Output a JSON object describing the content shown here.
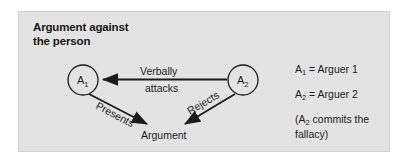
{
  "figure": {
    "title_line1": "Argument against",
    "title_line2": "the person",
    "panel_color": "#e3e3e3",
    "ink_color": "#1b1b1b"
  },
  "nodes": [
    {
      "id": "a1",
      "base": "A",
      "sub": "1",
      "cx": 83,
      "cy": 80,
      "r": 15
    },
    {
      "id": "a2",
      "base": "A",
      "sub": "2",
      "cx": 243,
      "cy": 80,
      "r": 15
    }
  ],
  "edges": [
    {
      "id": "attacks",
      "label_line1": "Verbally",
      "label_line2": "attacks",
      "from": "a2",
      "to": "a1"
    },
    {
      "id": "presents",
      "label": "Presents",
      "from": "a1",
      "to": "argument"
    },
    {
      "id": "rejects",
      "label": "Rejects",
      "from": "a2",
      "to": "argument"
    }
  ],
  "argument_node": {
    "label": "Argument"
  },
  "legend": {
    "row1_symbol": "A",
    "row1_sub": "1",
    "row1_text": " = Arguer 1",
    "row2_symbol": "A",
    "row2_sub": "2",
    "row2_text": " = Arguer 2",
    "row3_prefix": "(A",
    "row3_sub": "2",
    "row3_text": " commits the fallacy)"
  }
}
